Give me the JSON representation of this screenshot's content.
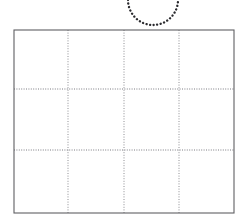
{
  "figure": {
    "background_color": "#ffffff",
    "width": 246,
    "height": 219
  },
  "arc": {
    "name": "dotted-semicircle-arc",
    "shape": "semicircle-open-upward",
    "color": "#2a2a2e",
    "center_x": 153,
    "center_y": 0,
    "radius": 25,
    "start_x": 128,
    "end_x": 178,
    "bottom_y": 26,
    "style": "dotted"
  },
  "grid": {
    "name": "rectangular-grid",
    "frame_color": "#5f5f63",
    "gridline_color": "#8e8e93",
    "gridline_style": "dotted",
    "left": 14,
    "top": 30,
    "right": 234,
    "bottom": 213,
    "columns": 4,
    "rows": 3,
    "vertical_gridlines_x": [
      68,
      124,
      179
    ],
    "horizontal_gridlines_y": [
      89,
      150
    ],
    "cropped_at_bottom": true
  }
}
